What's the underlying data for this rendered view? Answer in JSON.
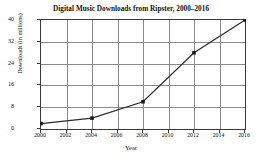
{
  "chart_data": {
    "type": "line",
    "title": "Digital Music Downloads from Ripster, 2000–2016",
    "xlabel": "Year",
    "ylabel": "Downloads (in millions)",
    "x": [
      2000,
      2004,
      2008,
      2012,
      2016
    ],
    "values": [
      2,
      4,
      10,
      28,
      40
    ],
    "series": [
      {
        "name": "Digital Music Downloads",
        "points": [
          {
            "x": 2000,
            "y": 2
          },
          {
            "x": 2004,
            "y": 4
          },
          {
            "x": 2008,
            "y": 10
          },
          {
            "x": 2012,
            "y": 28
          },
          {
            "x": 2016,
            "y": 40
          }
        ]
      }
    ],
    "xticks": [
      "2000",
      "2002",
      "2004",
      "2006",
      "2008",
      "2010",
      "2012",
      "2014",
      "2016"
    ],
    "xtick_values": [
      2000,
      2002,
      2004,
      2006,
      2008,
      2010,
      2012,
      2014,
      2016
    ],
    "yticks": [
      "0",
      "8",
      "16",
      "24",
      "32",
      "40"
    ],
    "ytick_values": [
      0,
      8,
      16,
      24,
      32,
      40
    ],
    "xlim": [
      2000,
      2016
    ],
    "ylim": [
      0,
      40
    ],
    "grid": true,
    "legend": false,
    "marker": "square",
    "line_color": "#2b2b2b",
    "marker_color": "#1a1a1a",
    "grid_color": "#8a8a8a",
    "axis_color": "#3a3a3a",
    "background_color": "#ffffff"
  }
}
